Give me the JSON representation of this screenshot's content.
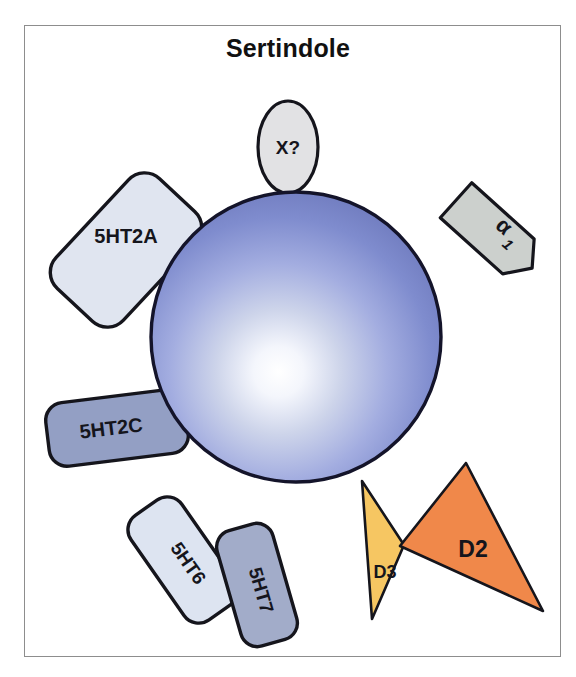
{
  "figure": {
    "title": "Sertindole",
    "frame_color": "#8d8d8d",
    "background": "#ffffff"
  },
  "sphere": {
    "name": "central-drug-sphere",
    "center_x": 296,
    "center_y": 337,
    "radius": 145,
    "highlight_color": "#ffffff",
    "edge_color": "#6b77b0",
    "outline_color": "#1a1a2e"
  },
  "receptors": [
    {
      "id": "x-unknown",
      "label": "X?",
      "shape": "ellipse",
      "fill": "#e2e2e4",
      "text_color": "#141414",
      "font_size": 19,
      "rotation": 0,
      "cx": 288,
      "cy": 147,
      "rx": 30,
      "ry": 46
    },
    {
      "id": "5ht2a",
      "label": "5HT2A",
      "shape": "rounded-rect",
      "fill": "#e0e5f0",
      "text_color": "#141414",
      "font_size": 20,
      "rotation": -47,
      "cx": 126,
      "cy": 250,
      "w": 150,
      "h": 92
    },
    {
      "id": "alpha1",
      "label": "α1",
      "label_base": "α",
      "label_sub": "1",
      "shape": "arrow-pennant",
      "fill": "#ccd0cd",
      "text_color": "#141414",
      "font_size": 21,
      "rotation": 42,
      "cx": 492,
      "cy": 232
    },
    {
      "id": "5ht2c",
      "label": "5HT2C",
      "shape": "rounded-rect",
      "fill": "#939fc4",
      "text_color": "#141414",
      "font_size": 20,
      "rotation": -7,
      "cx": 117,
      "cy": 428,
      "w": 140,
      "h": 64
    },
    {
      "id": "5ht6",
      "label": "5HT6",
      "shape": "rounded-rect",
      "fill": "#dde4f1",
      "text_color": "#141414",
      "font_size": 19,
      "rotation": 55,
      "cx": 183,
      "cy": 560,
      "w": 128,
      "h": 62
    },
    {
      "id": "5ht7",
      "label": "5HT7",
      "shape": "rounded-rect",
      "fill": "#a2acc9",
      "text_color": "#141414",
      "font_size": 19,
      "rotation": 74,
      "cx": 257,
      "cy": 585,
      "w": 120,
      "h": 58
    },
    {
      "id": "d3",
      "label": "D3",
      "shape": "triangle",
      "fill": "#f6c662",
      "text_color": "#2d1800",
      "font_size": 18,
      "rotation": 0,
      "points": "362,481 404,545 372,619",
      "label_x": 383,
      "label_y": 574
    },
    {
      "id": "d2",
      "label": "D2",
      "shape": "triangle",
      "fill": "#f0884a",
      "text_color": "#2d1800",
      "font_size": 23,
      "rotation": 0,
      "points": "466,463 400,546 543,611",
      "label_x": 473,
      "label_y": 552
    }
  ]
}
